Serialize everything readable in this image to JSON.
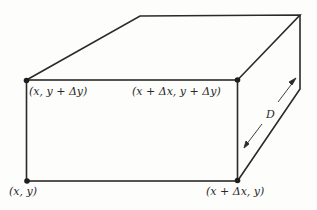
{
  "diagram": {
    "type": "3d-box-volume-element",
    "colors": {
      "stroke": "#2a2a2a",
      "background": "#fdfdfb"
    },
    "vertices": {
      "front_top_left": {
        "label": "(x, y + Δy)"
      },
      "front_top_right": {
        "label": "(x + Δx, y + Δy)"
      },
      "front_bottom_left": {
        "label": "(x, y)"
      },
      "front_bottom_right": {
        "label": "(x + Δx, y)"
      }
    },
    "depth": {
      "label": "D"
    }
  }
}
